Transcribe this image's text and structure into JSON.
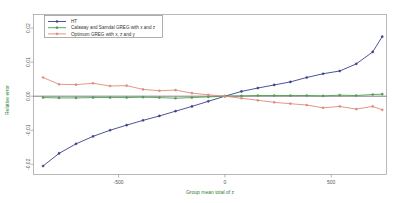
{
  "chart_data": {
    "type": "line",
    "title": "",
    "xlabel": "Group mean total of z",
    "ylabel": "Relative error",
    "xlim": [
      -900,
      760
    ],
    "ylim": [
      -0.023,
      0.024
    ],
    "xticks": [
      -500,
      0,
      500
    ],
    "xtick_labels": [
      "-500",
      "0",
      "500"
    ],
    "yticks": [
      -0.02,
      -0.01,
      0.0,
      0.01,
      0.02
    ],
    "ytick_labels": [
      "-0.02",
      "-0.01",
      "0.00",
      "0.01",
      "0.02"
    ],
    "grid": false,
    "legend_position": "top-left",
    "zero_reference_line": 0.0,
    "x": [
      -855,
      -780,
      -700,
      -620,
      -540,
      -462,
      -385,
      -308,
      -232,
      -155,
      -78,
      0,
      78,
      155,
      232,
      308,
      385,
      462,
      540,
      618,
      695,
      740
    ],
    "series": [
      {
        "name": "HT",
        "color": "#3b3f8c",
        "marker": "circle",
        "values": [
          -0.0205,
          -0.0168,
          -0.014,
          -0.0118,
          -0.01,
          -0.0085,
          -0.0071,
          -0.0058,
          -0.0044,
          -0.003,
          -0.0015,
          0.0,
          0.0014,
          0.0024,
          0.0033,
          0.0042,
          0.0055,
          0.0066,
          0.0074,
          0.0095,
          0.013,
          0.0175
        ]
      },
      {
        "name": "Calaway and Sarndal GREG with x and z",
        "color": "#4f9d52",
        "marker": "circle",
        "values": [
          -0.0004,
          -0.0005,
          -0.0005,
          -0.0004,
          -0.0004,
          -0.0004,
          -0.0003,
          -0.0004,
          -0.0006,
          -0.0004,
          -0.0002,
          0.0,
          0.0001,
          0.0002,
          0.0002,
          0.0002,
          0.0002,
          0.0001,
          0.0003,
          0.0002,
          0.0005,
          0.0006
        ]
      },
      {
        "name": "Optimum GREG with x, z and y",
        "color": "#e08a7d",
        "marker": "circle",
        "values": [
          0.0055,
          0.0035,
          0.0034,
          0.0038,
          0.003,
          0.0031,
          0.002,
          0.0016,
          0.0018,
          0.0009,
          0.0004,
          0.0,
          -0.0006,
          -0.0012,
          -0.0018,
          -0.0022,
          -0.0026,
          -0.0034,
          -0.003,
          -0.0038,
          -0.003,
          -0.004
        ]
      }
    ]
  },
  "legend": {
    "entries": [
      {
        "label": "HT"
      },
      {
        "label": "Calaway and Sarndal GREG with x and z"
      },
      {
        "label": "Optimum GREG with x, z and y"
      }
    ]
  },
  "colors": {
    "ht": "#3b3f8c",
    "greg_xz": "#4f9d52",
    "greg_opt": "#e08a7d",
    "axis_title": "#2e7d32",
    "frame": "#9a9a9a",
    "tick_text": "#555555"
  }
}
